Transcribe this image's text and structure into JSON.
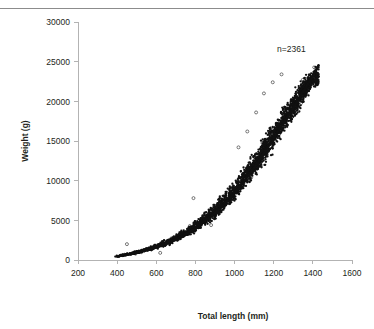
{
  "figure": {
    "top_rule": true,
    "background": "#ffffff"
  },
  "annotation": {
    "sample_size_label": "n=2361"
  },
  "axes": {
    "x_title": "Total length (mm)",
    "y_title": "Weight (g)",
    "x_ticks": [
      "200",
      "400",
      "600",
      "800",
      "1000",
      "1200",
      "1400",
      "1600"
    ],
    "y_ticks": [
      "0",
      "5000",
      "10000",
      "15000",
      "20000",
      "25000",
      "30000"
    ],
    "axis_color": "#b3b3b3",
    "text_color": "#231f20"
  },
  "chart_data": {
    "type": "scatter",
    "title": "",
    "subtitle": "",
    "xlabel": "Total length (mm)",
    "ylabel": "Weight (g)",
    "xlim": [
      200,
      1600
    ],
    "ylim": [
      0,
      30000
    ],
    "xticks": [
      200,
      400,
      600,
      800,
      1000,
      1200,
      1400,
      1600
    ],
    "yticks": [
      0,
      5000,
      10000,
      15000,
      20000,
      25000,
      30000
    ],
    "grid": false,
    "legend": null,
    "annotations": [
      {
        "text": "n=2361",
        "x": 1290,
        "y": 26200
      }
    ],
    "n_points": 2361,
    "marker": {
      "shape": "circle",
      "color": "#111111",
      "size": 1.6
    },
    "relationship": "power-law length-weight: weight grows roughly as length^3, dense band widening with length",
    "x_range_observed": [
      385,
      1430
    ],
    "y_range_observed": [
      180,
      24700
    ],
    "fit_curve": {
      "type": "power",
      "description": "W = a * L^b fitted through cloud centre",
      "x": [
        400,
        500,
        600,
        700,
        800,
        900,
        1000,
        1100,
        1200,
        1300,
        1400,
        1430
      ],
      "y": [
        450,
        900,
        1600,
        2600,
        4000,
        5900,
        8400,
        11600,
        15400,
        19200,
        23200,
        24600
      ]
    },
    "band": {
      "description": "approximate vertical spread (5th-95th pct) of the point cloud at given lengths",
      "x": [
        400,
        500,
        600,
        700,
        800,
        900,
        1000,
        1100,
        1200,
        1300,
        1400
      ],
      "y_low": [
        300,
        650,
        1150,
        1950,
        3000,
        4500,
        6600,
        9400,
        12600,
        16600,
        21000
      ],
      "y_high": [
        650,
        1250,
        2200,
        3500,
        5400,
        7800,
        10800,
        14400,
        18600,
        22400,
        25000
      ]
    },
    "outliers": [
      {
        "x": 450,
        "y": 2000
      },
      {
        "x": 620,
        "y": 900
      },
      {
        "x": 790,
        "y": 7800
      },
      {
        "x": 880,
        "y": 4400
      },
      {
        "x": 1020,
        "y": 14200
      },
      {
        "x": 1065,
        "y": 16200
      },
      {
        "x": 1110,
        "y": 18600
      },
      {
        "x": 1150,
        "y": 21000
      },
      {
        "x": 1195,
        "y": 22400
      },
      {
        "x": 1240,
        "y": 23400
      }
    ],
    "points_note": "2361 observations; rendered as a deterministic reconstruction matching the observed density envelope"
  }
}
